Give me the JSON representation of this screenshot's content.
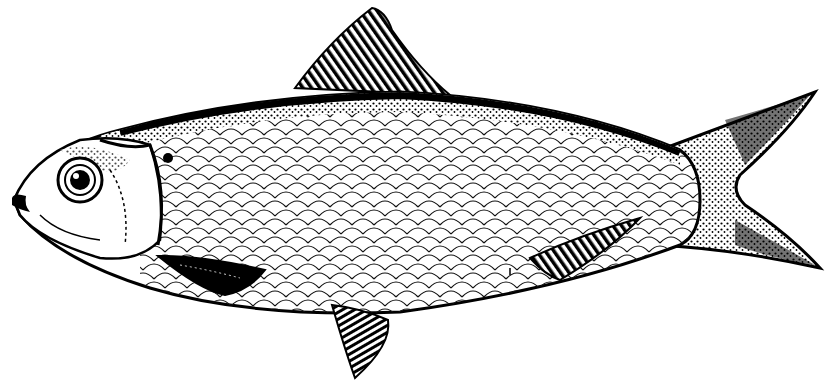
{
  "image": {
    "subject": "Fish illustration (herring / shad)",
    "style": "black-and-white engraving line drawing",
    "background_color": "#ffffff",
    "ink_color": "#000000"
  },
  "parts": {
    "head": "head-with-eye-and-gill-cover",
    "eye": "round-eye",
    "mouth": "protruding-lower-jaw",
    "body": "scaled-body",
    "dorsal_fin": "dorsal-fin",
    "pectoral_fin": "dark-pectoral-fin",
    "pelvic_fin": "pelvic-fin",
    "anal_fin": "anal-fin",
    "caudal_fin": "forked-tail"
  }
}
